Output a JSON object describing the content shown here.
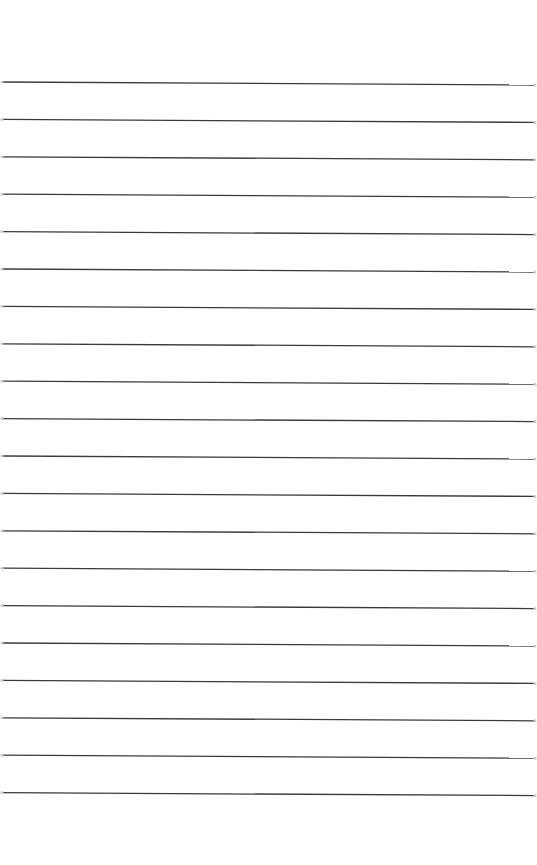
{
  "page": {
    "type": "lined-paper",
    "background_color": "#ffffff",
    "line_color": "#3a3a3a",
    "line_count": 20,
    "first_line_left_y": 82,
    "first_line_right_y": 85,
    "line_spacing": 37.4,
    "line_x_start": 3,
    "line_x_end": 534,
    "line_width": 1.3
  }
}
